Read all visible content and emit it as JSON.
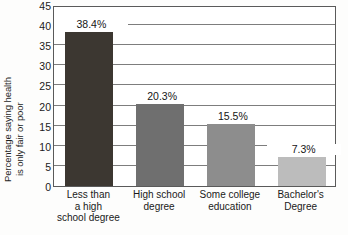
{
  "chart_data": {
    "type": "bar",
    "title": "",
    "xlabel": "",
    "ylabel": "Percentage saying health is only fair or poor",
    "ylabel_line1": "Percentage saying health",
    "ylabel_line2": "is only fair or poor",
    "categories": [
      "Less than a high school degree",
      "High school degree",
      "Some college education",
      "Bachelor's Degree"
    ],
    "category_lines": [
      [
        "Less than",
        "a high",
        "school degree"
      ],
      [
        "High school",
        "degree"
      ],
      [
        "Some college",
        "education"
      ],
      [
        "Bachelor's",
        "Degree"
      ]
    ],
    "values": [
      38.4,
      20.3,
      15.5,
      7.3
    ],
    "value_labels": [
      "38.4%",
      "20.3%",
      "15.5%",
      "7.3%"
    ],
    "ylim": [
      0,
      45
    ],
    "yticks": [
      0,
      5,
      10,
      15,
      20,
      25,
      30,
      35,
      40,
      45
    ],
    "ytick_labels": [
      "0",
      "5",
      "10",
      "15",
      "20",
      "25",
      "30",
      "35",
      "40",
      "45"
    ],
    "grid": true,
    "grid_axis": "y",
    "legend": "none",
    "bar_colors": [
      "#3c3731",
      "#6f6f6f",
      "#8d8d8d",
      "#bcbcbc"
    ]
  },
  "caption": {
    "text": ""
  }
}
